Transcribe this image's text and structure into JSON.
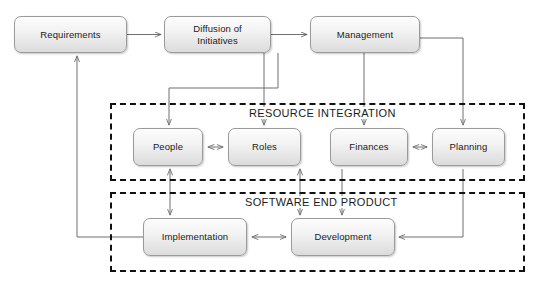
{
  "diagram": {
    "title_fragment": "",
    "background_color": "#ffffff",
    "node_fill_top": "#fdfdfd",
    "node_fill_bottom": "#dcdcdc",
    "node_border_color": "#9a9a9a",
    "group_border_color": "#111111",
    "connector_color": "#6f6f6f",
    "nodes": [
      {
        "id": "requirements",
        "label": "Requirements",
        "label_line2": "",
        "x": 14,
        "y": 16,
        "w": 113,
        "h": 37
      },
      {
        "id": "diffusion",
        "label": "Diffusion of",
        "label_line2": "Initiatives",
        "x": 164,
        "y": 16,
        "w": 107,
        "h": 37
      },
      {
        "id": "management",
        "label": "Management",
        "label_line2": "",
        "x": 310,
        "y": 16,
        "w": 110,
        "h": 37
      },
      {
        "id": "people",
        "label": "People",
        "label_line2": "",
        "x": 133,
        "y": 128,
        "w": 70,
        "h": 38
      },
      {
        "id": "roles",
        "label": "Roles",
        "label_line2": "",
        "x": 228,
        "y": 128,
        "w": 73,
        "h": 38
      },
      {
        "id": "finances",
        "label": "Finances",
        "label_line2": "",
        "x": 330,
        "y": 128,
        "w": 78,
        "h": 38
      },
      {
        "id": "planning",
        "label": "Planning",
        "label_line2": "",
        "x": 432,
        "y": 128,
        "w": 73,
        "h": 38
      },
      {
        "id": "implementation",
        "label": "Implementation",
        "label_line2": "",
        "x": 143,
        "y": 218,
        "w": 104,
        "h": 38
      },
      {
        "id": "development",
        "label": "Development",
        "label_line2": "",
        "x": 291,
        "y": 218,
        "w": 104,
        "h": 38
      }
    ],
    "groups": [
      {
        "id": "resource-integration",
        "label": "RESOURCE INTEGRATION",
        "x": 110,
        "y": 103,
        "w": 415,
        "h": 78,
        "title_x": 247,
        "title_y": 108
      },
      {
        "id": "software-end-product",
        "label": "SOFTWARE END PRODUCT",
        "x": 110,
        "y": 192,
        "w": 415,
        "h": 80,
        "title_x": 243,
        "title_y": 197
      }
    ],
    "edges": [
      {
        "id": "requirements-to-diffusion",
        "from": "requirements",
        "to": "diffusion",
        "arrows": "single"
      },
      {
        "id": "diffusion-to-management",
        "from": "diffusion",
        "to": "management",
        "arrows": "single"
      },
      {
        "id": "diffusion-to-people",
        "from": "diffusion",
        "to": "people",
        "arrows": "single"
      },
      {
        "id": "management-to-roles",
        "from": "management",
        "to": "roles",
        "arrows": "single"
      },
      {
        "id": "management-to-finances",
        "from": "management",
        "to": "finances",
        "arrows": "single"
      },
      {
        "id": "management-to-planning",
        "from": "management",
        "to": "planning",
        "arrows": "single"
      },
      {
        "id": "people-roles",
        "from": "people",
        "to": "roles",
        "arrows": "double"
      },
      {
        "id": "finances-planning",
        "from": "finances",
        "to": "planning",
        "arrows": "double"
      },
      {
        "id": "people-implementation",
        "from": "people",
        "to": "implementation",
        "arrows": "double"
      },
      {
        "id": "roles-development",
        "from": "roles",
        "to": "development",
        "arrows": "double"
      },
      {
        "id": "finances-to-development",
        "from": "finances",
        "to": "development",
        "arrows": "single"
      },
      {
        "id": "implementation-development",
        "from": "implementation",
        "to": "development",
        "arrows": "double"
      },
      {
        "id": "planning-to-development",
        "from": "planning",
        "to": "development",
        "arrows": "single"
      },
      {
        "id": "implementation-to-requirements",
        "from": "implementation",
        "to": "requirements",
        "arrows": "single"
      }
    ]
  }
}
